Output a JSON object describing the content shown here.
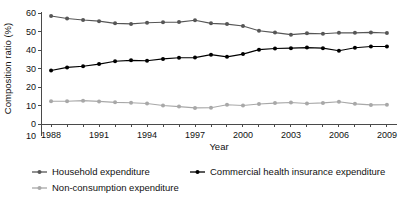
{
  "chart_data": {
    "type": "line",
    "title": "",
    "xlabel": "Year",
    "ylabel": "Composition ratio (%)",
    "xlim": [
      1987.4,
      2009.6
    ],
    "ylim": [
      0,
      60
    ],
    "ytick_values": [
      0,
      10,
      20,
      30,
      40,
      50,
      60
    ],
    "ytick_labels": [
      "0",
      "10",
      "20",
      "30",
      "40",
      "50",
      "60"
    ],
    "extra_lower_label": "10",
    "xtick_labels": [
      "1988",
      "1991",
      "1994",
      "1997",
      "2000",
      "2003",
      "2006",
      "2009"
    ],
    "xtick_values": [
      1988,
      1991,
      1994,
      1997,
      2000,
      2003,
      2006,
      2009
    ],
    "minor_xticks_every": 1,
    "grid": false,
    "legend_position": "below",
    "x": [
      1988,
      1989,
      1990,
      1991,
      1992,
      1993,
      1994,
      1995,
      1996,
      1997,
      1998,
      1999,
      2000,
      2001,
      2002,
      2003,
      2004,
      2005,
      2006,
      2007,
      2008,
      2009
    ],
    "categories": [
      "1988",
      "1989",
      "1990",
      "1991",
      "1992",
      "1993",
      "1994",
      "1995",
      "1996",
      "1997",
      "1998",
      "1999",
      "2000",
      "2001",
      "2002",
      "2003",
      "2004",
      "2005",
      "2006",
      "2007",
      "2008",
      "2009"
    ],
    "series": [
      {
        "name": "Household expenditure",
        "color": "#565656",
        "marker": "circle",
        "values": [
          58.4,
          57.0,
          56.2,
          55.6,
          54.4,
          54.1,
          54.7,
          55.0,
          55.1,
          56.1,
          54.4,
          54.0,
          53.0,
          50.4,
          49.4,
          48.3,
          49.0,
          48.8,
          49.3,
          49.3,
          49.5,
          49.2
        ]
      },
      {
        "name": "Commercial health insurance expenditure",
        "color": "#000000",
        "marker": "circle",
        "values": [
          28.9,
          30.6,
          31.2,
          32.4,
          33.9,
          34.4,
          34.2,
          35.2,
          35.8,
          35.9,
          37.5,
          36.3,
          37.8,
          40.2,
          40.8,
          41.0,
          41.3,
          41.0,
          39.6,
          41.2,
          41.9,
          41.9
        ]
      },
      {
        "name": "Non-consumption expenditure",
        "color": "#a8a8a8",
        "marker": "circle",
        "values": [
          12.3,
          12.3,
          12.6,
          12.2,
          11.7,
          11.5,
          11.1,
          10.0,
          9.4,
          8.7,
          8.8,
          10.4,
          10.0,
          10.8,
          11.3,
          11.6,
          11.1,
          11.4,
          12.0,
          10.9,
          10.3,
          10.4
        ]
      }
    ],
    "legend_entries": [
      {
        "label": "Household expenditure",
        "color": "#565656"
      },
      {
        "label": "Commercial health insurance expenditure",
        "color": "#000000"
      },
      {
        "label": "Non-consumption expenditure",
        "color": "#a8a8a8"
      }
    ]
  }
}
